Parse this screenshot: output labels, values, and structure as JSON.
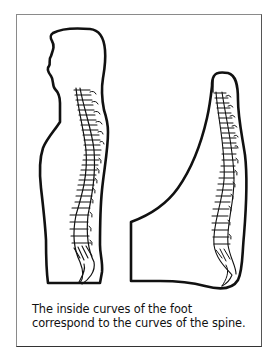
{
  "figure": {
    "caption_lines": [
      "The inside curves of the foot",
      "correspond to the curves of the spine."
    ],
    "panels": [
      {
        "name": "human-profile",
        "description": "Side silhouette of a person with spine drawn inside"
      },
      {
        "name": "foot-profile",
        "description": "Side view of a foot with spine overlaid along its inner curve"
      }
    ],
    "colors": {
      "ink": "#111111",
      "background": "#ffffff",
      "frame": "#8a8a8a"
    }
  }
}
